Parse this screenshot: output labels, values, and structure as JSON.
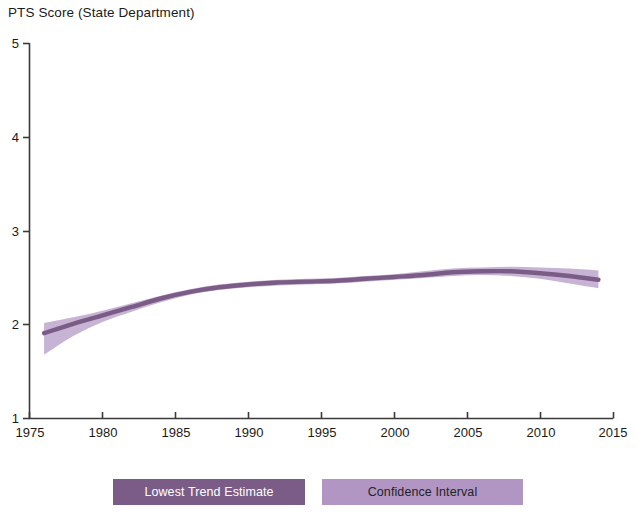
{
  "chart_data": {
    "type": "line",
    "title": "PTS Score (State Department)",
    "xlabel": "",
    "ylabel": "PTS Score (State Department)",
    "xlim": [
      1975,
      2015
    ],
    "ylim": [
      1,
      5
    ],
    "grid": false,
    "legend_position": "bottom",
    "x_ticks": [
      1975,
      1980,
      1985,
      1990,
      1995,
      2000,
      2005,
      2010,
      2015
    ],
    "y_ticks": [
      1,
      2,
      3,
      4,
      5
    ],
    "colors": {
      "trend": "#7b5c87",
      "confidence_band": "#b196c4",
      "axis": "#3a3a3a",
      "text": "#1a1a1a"
    },
    "x": [
      1976,
      1978,
      1980,
      1982,
      1984,
      1986,
      1988,
      1990,
      1992,
      1994,
      1996,
      1998,
      2000,
      2002,
      2004,
      2006,
      2008,
      2010,
      2012,
      2014
    ],
    "series": [
      {
        "name": "Lowest Trend Estimate",
        "values": [
          1.91,
          2.01,
          2.1,
          2.19,
          2.28,
          2.35,
          2.4,
          2.43,
          2.45,
          2.46,
          2.47,
          2.49,
          2.51,
          2.53,
          2.56,
          2.57,
          2.57,
          2.55,
          2.52,
          2.48
        ]
      },
      {
        "name": "Confidence Interval Upper",
        "values": [
          2.02,
          2.08,
          2.15,
          2.23,
          2.31,
          2.38,
          2.43,
          2.46,
          2.48,
          2.49,
          2.5,
          2.52,
          2.54,
          2.57,
          2.6,
          2.61,
          2.62,
          2.61,
          2.6,
          2.58
        ]
      },
      {
        "name": "Confidence Interval Lower",
        "values": [
          1.68,
          1.88,
          2.03,
          2.14,
          2.24,
          2.32,
          2.37,
          2.4,
          2.42,
          2.43,
          2.44,
          2.46,
          2.48,
          2.5,
          2.52,
          2.53,
          2.52,
          2.49,
          2.44,
          2.39
        ]
      }
    ],
    "legend": [
      {
        "label": "Lowest Trend Estimate",
        "swatch": "#7b5c87",
        "text_color": "#ffffff"
      },
      {
        "label": "Confidence Interval",
        "swatch": "#b196c4",
        "text_color": "#232323"
      }
    ]
  },
  "axes": {
    "y_labels": [
      "5",
      "4",
      "3",
      "2",
      "1"
    ],
    "x_labels": [
      "1975",
      "1980",
      "1985",
      "1990",
      "1995",
      "2000",
      "2005",
      "2010",
      "2015"
    ]
  }
}
